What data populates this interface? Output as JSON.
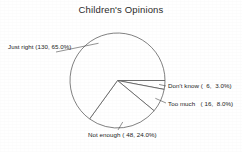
{
  "chart_data": {
    "type": "pie",
    "title": "Children's Opinions",
    "xlabel": "",
    "ylabel": "",
    "legend_position": "none",
    "grid": false,
    "total": 200,
    "categories": [
      "Don't know",
      "Too much",
      "Not enough",
      "Just right"
    ],
    "values": [
      6,
      16,
      48,
      130
    ],
    "percentages": [
      3.0,
      8.0,
      24.0,
      65.0
    ],
    "slices": [
      {
        "name": "Don't know",
        "count": 6,
        "percent": 3.0,
        "label": "Don't know (  6,  3.0%)",
        "label_position": "right",
        "start_angle_deg": 0,
        "end_angle_deg": 10.8
      },
      {
        "name": "Too much",
        "count": 16,
        "percent": 8.0,
        "label": "Too much   ( 16,  8.0%)",
        "label_position": "right",
        "start_angle_deg": 10.8,
        "end_angle_deg": 39.6
      },
      {
        "name": "Not enough",
        "count": 48,
        "percent": 24.0,
        "label": "Not enough ( 48, 24.0%)",
        "label_position": "bottom",
        "start_angle_deg": 39.6,
        "end_angle_deg": 126.0
      },
      {
        "name": "Just right",
        "count": 130,
        "percent": 65.0,
        "label": "Just right (130, 65.0%)",
        "label_position": "left",
        "start_angle_deg": 126.0,
        "end_angle_deg": 360.0
      }
    ],
    "colors": {
      "background": "#ffffff",
      "slice_fill": "#ffffff",
      "slice_outline": "#4a4a4a",
      "text": "#232323",
      "title_text": "#2b2b2b"
    },
    "geometry": {
      "center_x": 117.5,
      "center_y": 80.5,
      "radius": 47.5,
      "direction": "clockwise",
      "start_at": "3-o-clock"
    }
  }
}
